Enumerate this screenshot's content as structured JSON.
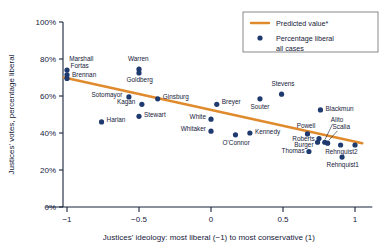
{
  "chart_data": {
    "type": "scatter",
    "title": "",
    "xlabel": "Justices' ideology: most liberal (−1) to most conservative (1)",
    "ylabel": "Justices' votes, percentage liberal",
    "xlim": [
      -1.15,
      1.12
    ],
    "ylim": [
      0,
      100
    ],
    "xticks": [
      -1,
      -0.5,
      0,
      0.5,
      1
    ],
    "xticklabels": [
      "−1",
      "−0.5",
      "0",
      "0.5",
      "1"
    ],
    "yticks": [
      0,
      20,
      40,
      60,
      80,
      100
    ],
    "yticklabels": [
      "0%",
      "20%",
      "40%",
      "60%",
      "80%",
      "100%"
    ],
    "grid": false,
    "legend_position": "top-right",
    "colors": {
      "point": "#1f3a6e",
      "line": "#e08a2e",
      "axis": "#16213a",
      "text": "#16213a",
      "background": "#ffffff"
    },
    "legend": [
      {
        "key": "predicted-line",
        "label": "Predicted value*",
        "marker": "line",
        "color": "#e08a2e"
      },
      {
        "key": "percentage-liberal",
        "label": "Percentage liberal",
        "label2": "all cases",
        "marker": "dot",
        "color": "#1f3a6e"
      }
    ],
    "series": [
      {
        "name": "Predicted value*",
        "type": "line",
        "color": "#e08a2e",
        "x": [
          -1.02,
          1.05
        ],
        "y": [
          70.0,
          34.5
        ]
      },
      {
        "name": "Percentage liberal all cases",
        "type": "scatter",
        "color": "#1f3a6e",
        "points": [
          {
            "label": "Marshall",
            "x": -1.0,
            "y": 74.0,
            "lx": -0.985,
            "ly": 80.0,
            "anchor": "start"
          },
          {
            "label": "Fortas",
            "x": -1.0,
            "y": 71.5,
            "lx": -0.975,
            "ly": 76.0,
            "anchor": "start"
          },
          {
            "label": "Brennan",
            "x": -1.0,
            "y": 69.5,
            "lx": -0.965,
            "ly": 71.5,
            "anchor": "start"
          },
          {
            "label": "Warren",
            "x": -0.5,
            "y": 74.5,
            "lx": -0.505,
            "ly": 80.0,
            "anchor": "middle"
          },
          {
            "label": "Goldberg",
            "x": -0.5,
            "y": 72.5,
            "lx": -0.495,
            "ly": 68.5,
            "anchor": "middle"
          },
          {
            "label": "Sotomayor",
            "x": -0.57,
            "y": 59.5,
            "lx": -0.615,
            "ly": 60.5,
            "anchor": "end"
          },
          {
            "label": "Kagan",
            "x": -0.48,
            "y": 55.5,
            "lx": -0.525,
            "ly": 56.5,
            "anchor": "end"
          },
          {
            "label": "Ginsburg",
            "x": -0.37,
            "y": 58.5,
            "lx": -0.335,
            "ly": 59.5,
            "anchor": "start"
          },
          {
            "label": "Stewart",
            "x": -0.5,
            "y": 49.0,
            "lx": -0.465,
            "ly": 50.0,
            "anchor": "start"
          },
          {
            "label": "Harlan",
            "x": -0.76,
            "y": 46.0,
            "lx": -0.725,
            "ly": 47.0,
            "anchor": "start"
          },
          {
            "label": "Breyer",
            "x": 0.04,
            "y": 55.5,
            "lx": 0.075,
            "ly": 56.5,
            "anchor": "start"
          },
          {
            "label": "White",
            "x": 0.0,
            "y": 47.5,
            "lx": -0.035,
            "ly": 48.5,
            "anchor": "end"
          },
          {
            "label": "Whitaker",
            "x": 0.0,
            "y": 41.0,
            "lx": -0.035,
            "ly": 42.0,
            "anchor": "end"
          },
          {
            "label": "O'Connor",
            "x": 0.17,
            "y": 39.0,
            "lx": 0.175,
            "ly": 34.5,
            "anchor": "middle"
          },
          {
            "label": "Kennedy",
            "x": 0.27,
            "y": 40.0,
            "lx": 0.305,
            "ly": 40.5,
            "anchor": "start"
          },
          {
            "label": "Souter",
            "x": 0.34,
            "y": 58.5,
            "lx": 0.34,
            "ly": 54.0,
            "anchor": "middle"
          },
          {
            "label": "Stevens",
            "x": 0.49,
            "y": 61.0,
            "lx": 0.5,
            "ly": 66.5,
            "anchor": "middle"
          },
          {
            "label": "Blackmun",
            "x": 0.76,
            "y": 52.5,
            "lx": 0.795,
            "ly": 53.0,
            "anchor": "start"
          },
          {
            "label": "Powell",
            "x": 0.67,
            "y": 39.5,
            "lx": 0.66,
            "ly": 44.0,
            "anchor": "middle"
          },
          {
            "label": "Roberts",
            "x": 0.75,
            "y": 37.0,
            "lx": 0.72,
            "ly": 37.0,
            "anchor": "end"
          },
          {
            "label": "Burger",
            "x": 0.74,
            "y": 35.0,
            "lx": 0.712,
            "ly": 33.5,
            "anchor": "end"
          },
          {
            "label": "Thomas",
            "x": 0.68,
            "y": 30.0,
            "lx": 0.65,
            "ly": 30.5,
            "anchor": "end"
          },
          {
            "label": "Alito",
            "x": 0.79,
            "y": 35.0,
            "lx": 0.875,
            "ly": 47.0,
            "anchor": "middle"
          },
          {
            "label": "Scalia",
            "x": 0.81,
            "y": 34.5,
            "lx": 0.905,
            "ly": 43.0,
            "anchor": "middle"
          },
          {
            "label": "Rehnquist2",
            "x": 0.9,
            "y": 33.5,
            "lx": 0.905,
            "ly": 29.5,
            "anchor": "middle"
          },
          {
            "label": "Rehnquist1",
            "x": 0.91,
            "y": 27.0,
            "lx": 0.915,
            "ly": 22.5,
            "anchor": "middle"
          },
          {
            "label": "",
            "x": 1.0,
            "y": 33.5,
            "lx": 1.0,
            "ly": 33.5,
            "anchor": "middle"
          }
        ],
        "leader_lines": [
          {
            "name": "alito-leader",
            "x1": 0.845,
            "y1": 45.0,
            "x2": 0.792,
            "y2": 36.5
          },
          {
            "name": "scalia-leader",
            "x1": 0.878,
            "y1": 41.2,
            "x2": 0.818,
            "y2": 36.0
          }
        ]
      }
    ]
  }
}
